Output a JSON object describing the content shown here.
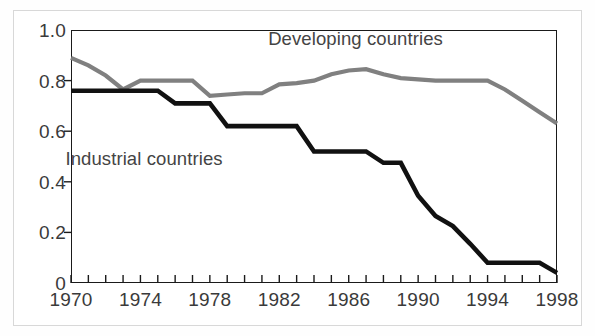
{
  "figure": {
    "background_color": "#ffffff",
    "frame_color": "#d8d8d8",
    "axis_color": "#1a1a1a"
  },
  "chart_data": {
    "type": "line",
    "title": "",
    "subtitle": "",
    "xlabel": "",
    "ylabel": "",
    "xlim": [
      1970,
      1998
    ],
    "ylim": [
      0,
      1.0
    ],
    "grid": false,
    "legend_position": "inline-annotations",
    "x_tick_labels": [
      "1970",
      "1974",
      "1978",
      "1982",
      "1986",
      "1990",
      "1994",
      "1998"
    ],
    "x_tick_values": [
      1970,
      1974,
      1978,
      1982,
      1986,
      1990,
      1994,
      1998
    ],
    "x_minor_ticks": [
      1970,
      1971,
      1972,
      1973,
      1974,
      1975,
      1976,
      1977,
      1978,
      1979,
      1980,
      1981,
      1982,
      1983,
      1984,
      1985,
      1986,
      1987,
      1988,
      1989,
      1990,
      1991,
      1992,
      1993,
      1994,
      1995,
      1996,
      1997,
      1998
    ],
    "y_tick_labels": [
      "1.0",
      "0.8",
      "0.6",
      "0.4",
      "0.2",
      "0"
    ],
    "y_tick_values": [
      1.0,
      0.8,
      0.6,
      0.4,
      0.2,
      0
    ],
    "x": [
      1970,
      1971,
      1972,
      1973,
      1974,
      1975,
      1976,
      1977,
      1978,
      1979,
      1980,
      1981,
      1982,
      1983,
      1984,
      1985,
      1986,
      1987,
      1988,
      1989,
      1990,
      1991,
      1992,
      1993,
      1994,
      1995,
      1996,
      1997,
      1998
    ],
    "series": [
      {
        "name": "Developing countries",
        "color": "#808080",
        "line_width": 4.2,
        "label_x": 1986.4,
        "label_y": 0.965,
        "values": [
          0.89,
          0.86,
          0.82,
          0.765,
          0.8,
          0.8,
          0.8,
          0.8,
          0.74,
          0.745,
          0.75,
          0.75,
          0.785,
          0.79,
          0.8,
          0.825,
          0.84,
          0.845,
          0.825,
          0.81,
          0.805,
          0.8,
          0.8,
          0.8,
          0.8,
          0.765,
          0.72,
          0.675,
          0.63
        ]
      },
      {
        "name": "Industrial countries",
        "color": "#111111",
        "line_width": 4.6,
        "label_x": 1974.2,
        "label_y": 0.49,
        "values": [
          0.76,
          0.76,
          0.76,
          0.76,
          0.76,
          0.76,
          0.71,
          0.71,
          0.71,
          0.62,
          0.62,
          0.62,
          0.62,
          0.62,
          0.52,
          0.52,
          0.52,
          0.52,
          0.475,
          0.475,
          0.345,
          0.265,
          0.225,
          0.155,
          0.08,
          0.08,
          0.08,
          0.08,
          0.04
        ]
      }
    ]
  },
  "annotations": {
    "developing_label": "Developing countries",
    "industrial_label": "Industrial countries"
  }
}
